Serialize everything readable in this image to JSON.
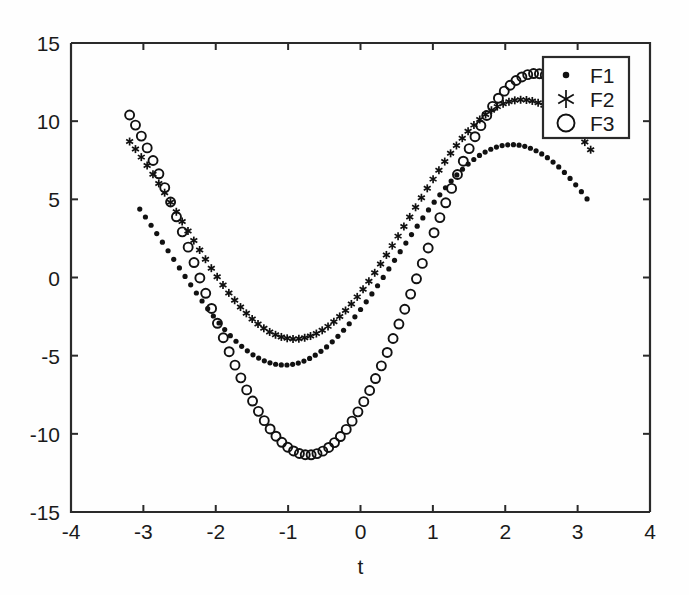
{
  "chart_data": {
    "type": "scatter",
    "title": "",
    "xlabel": "t",
    "ylabel": "",
    "xlim": [
      -4,
      4
    ],
    "ylim": [
      -15,
      15
    ],
    "xticks": [
      -4,
      -3,
      -2,
      -1,
      0,
      1,
      2,
      3,
      4
    ],
    "xticklabels": [
      "-4",
      "-3",
      "-2",
      "-1",
      "0",
      "1",
      "2",
      "3",
      "4"
    ],
    "yticks": [
      -15,
      -10,
      -5,
      0,
      5,
      10,
      15
    ],
    "yticklabels": [
      "-15",
      "-10",
      "-5",
      "0",
      "5",
      "10",
      "15"
    ],
    "grid": false,
    "legend_position": "top-right",
    "legend_entries": [
      {
        "label": "F1",
        "marker": "dot"
      },
      {
        "label": "F2",
        "marker": "asterisk"
      },
      {
        "label": "F3",
        "marker": "circle"
      }
    ],
    "x_domain": [
      -3.1416,
      3.1416
    ],
    "n_points": 80,
    "series": [
      {
        "name": "F1",
        "marker": "dot",
        "marker_size": 5.2,
        "amplitude": 7.05,
        "phase": -0.52,
        "offset": 1.45,
        "x_start": -3.05,
        "x_end": 3.13,
        "y_start": -2.6,
        "y_end": -2.7,
        "y_min": -5.6,
        "y_min_at_x": -2.2,
        "y_max": 8.5,
        "y_max_at_x": 1.05
      },
      {
        "name": "F2",
        "marker": "asterisk",
        "marker_size": 8.0,
        "amplitude": 7.65,
        "phase": -0.66,
        "offset": 3.72,
        "x_start": -3.19,
        "x_end": 3.18,
        "y_start": 0.4,
        "y_end": 0.5,
        "y_min": -3.9,
        "y_min_at_x": -2.05,
        "y_max": 11.4,
        "y_max_at_x": 1.25
      },
      {
        "name": "F3",
        "marker": "circle",
        "marker_size": 9.0,
        "amplitude": 12.2,
        "phase": -0.85,
        "offset": 0.85,
        "x_start": -3.19,
        "x_end": 3.2,
        "y_start": -8.0,
        "y_end": -8.2,
        "y_min": -11.4,
        "y_min_at_x": -2.35,
        "y_max": 13.05,
        "y_max_at_x": 0.72
      }
    ]
  },
  "axes": {
    "xlabel": "t"
  },
  "colors": {
    "foreground": "#111111",
    "axis": "#2a2a2a",
    "background": "#ffffff"
  }
}
